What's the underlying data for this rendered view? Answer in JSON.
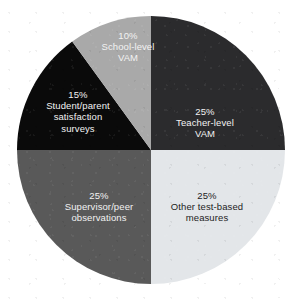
{
  "chart_data": {
    "type": "pie",
    "title": "",
    "subtitle": "",
    "xlabel": "",
    "ylabel": "",
    "legend_position": "none",
    "grid": false,
    "labels_inside_slices": true,
    "total": 100,
    "units": "%",
    "background_color": "#ffffff",
    "center": {
      "x": 151,
      "y": 150
    },
    "radius": 134,
    "start_angle_deg": 0,
    "direction": "clockwise",
    "categories": [
      "Teacher-level VAM",
      "Other test-based measures",
      "Supervisor/peer observations",
      "Student/parent satisfaction surveys",
      "School-level VAM"
    ],
    "values": [
      25,
      25,
      25,
      15,
      10
    ],
    "slices": [
      {
        "id": "teacher-level-vam",
        "percent_label": "25%",
        "name": "Teacher-level VAM",
        "name_lines": [
          "Teacher-level",
          "VAM"
        ],
        "value": 25,
        "color": "#2b2b2d",
        "text_color": "#f2f2f2",
        "start_angle_deg": 0,
        "end_angle_deg": 90
      },
      {
        "id": "other-test-based-measures",
        "percent_label": "25%",
        "name": "Other test-based measures",
        "name_lines": [
          "Other test-based",
          "measures"
        ],
        "value": 25,
        "color": "#e3e6e9",
        "text_color": "#1d1d1d",
        "start_angle_deg": 90,
        "end_angle_deg": 180
      },
      {
        "id": "supervisor-peer-observations",
        "percent_label": "25%",
        "name": "Supervisor/peer observations",
        "name_lines": [
          "Supervisor/peer",
          "observations"
        ],
        "value": 25,
        "color": "#595959",
        "text_color": "#f2f2f2",
        "start_angle_deg": 180,
        "end_angle_deg": 270
      },
      {
        "id": "student-parent-satisfaction-surveys",
        "percent_label": "15%",
        "name": "Student/parent satisfaction surveys",
        "name_lines": [
          "Student/parent",
          "satisfaction",
          "surveys"
        ],
        "value": 15,
        "color": "#0a0a0a",
        "text_color": "#f2f2f2",
        "start_angle_deg": 270,
        "end_angle_deg": 324
      },
      {
        "id": "school-level-vam",
        "percent_label": "10%",
        "name": "School-level VAM",
        "name_lines": [
          "School-level",
          "VAM"
        ],
        "value": 10,
        "color": "#a9a9a9",
        "text_color": "#f2f2f2",
        "start_angle_deg": 324,
        "end_angle_deg": 360
      }
    ]
  }
}
